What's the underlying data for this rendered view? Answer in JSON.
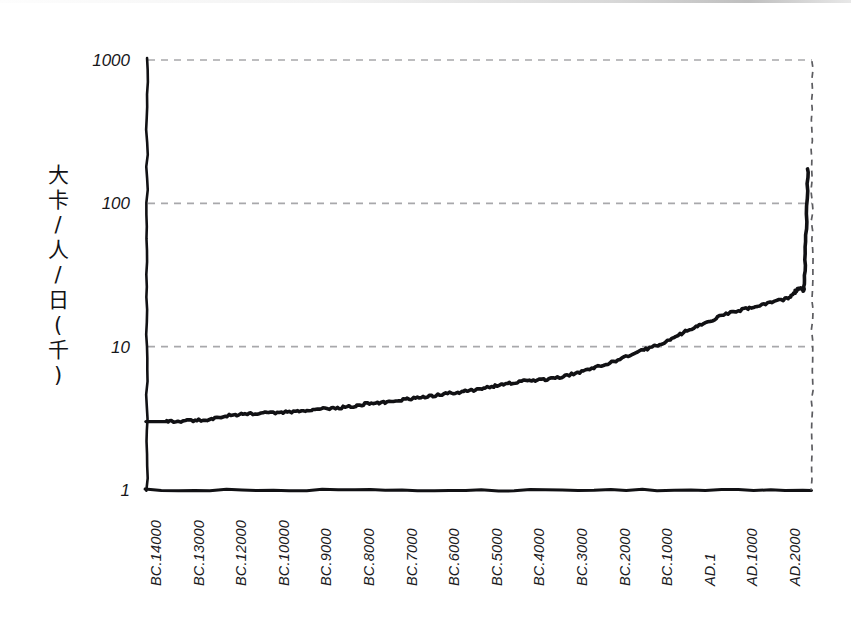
{
  "figure": {
    "kind": "hand-drawn-line-chart",
    "y_axis_title": "大卡/人/日(千)",
    "y_axis_title_chars": [
      "大",
      "卡",
      "/",
      "人",
      "/",
      "日",
      "(",
      "千",
      ")"
    ],
    "ink_color": "#111114",
    "gridline_color": "#a8a8ab",
    "background_color": "#ffffff"
  },
  "chart_data": {
    "type": "line",
    "title": "",
    "subtitle": "",
    "xlabel": "",
    "ylabel": "大卡/人/日(千)",
    "yscale": "log",
    "ylim": [
      1,
      1000
    ],
    "ytick_labels": [
      "1000",
      "100",
      "10",
      "1"
    ],
    "ytick_values": [
      1000,
      100,
      10,
      1
    ],
    "grid": "horizontal dashed at 1000, 100, 10",
    "legend": "none",
    "xtick_labels": [
      "BC.14000",
      "BC.13000",
      "BC.12000",
      "BC.10000",
      "BC.9000",
      "BC.8000",
      "BC.7000",
      "BC.6000",
      "BC.5000",
      "BC.4000",
      "BC.3000",
      "BC.2000",
      "BC.1000",
      "AD.1",
      "AD.1000",
      "AD.2000"
    ],
    "x": [
      -14000,
      -13500,
      -13000,
      -12500,
      -12000,
      -11500,
      -11000,
      -10500,
      -10000,
      -9500,
      -9000,
      -8500,
      -8000,
      -7500,
      -7000,
      -6500,
      -6000,
      -5500,
      -5000,
      -4500,
      -4000,
      -3500,
      -3000,
      -2500,
      -2000,
      -1500,
      -1000,
      -500,
      1,
      500,
      1000,
      1500,
      1700,
      1800,
      1850,
      1900,
      1950,
      2000
    ],
    "values": [
      3.0,
      3.05,
      3.1,
      3.3,
      3.4,
      3.45,
      3.5,
      3.6,
      3.7,
      3.8,
      4.0,
      4.1,
      4.3,
      4.5,
      4.7,
      4.9,
      5.2,
      5.5,
      5.8,
      5.9,
      6.3,
      6.9,
      7.6,
      8.6,
      9.7,
      11.0,
      13.0,
      15.0,
      17.0,
      18.5,
      20.0,
      22.0,
      24.5,
      25.5,
      25.5,
      26.0,
      60.0,
      175.0
    ],
    "annotations": [
      {
        "label": "curve starts",
        "value": 3.0
      },
      {
        "label": "crosses 10",
        "value": 10
      },
      {
        "label": "plateau AD.1–AD.1800",
        "value": 25
      },
      {
        "label": "peak AD.2000",
        "value": 175
      }
    ]
  }
}
